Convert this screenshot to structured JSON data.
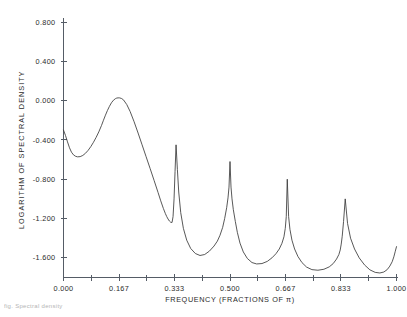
{
  "figure": {
    "caption_partial": "fig. Spectral density"
  },
  "chart_data": {
    "type": "line",
    "title": "",
    "xlabel": "FREQUENCY (FRACTIONS OF π)",
    "ylabel": "LOGARITHM OF SPECTRAL DENSITY",
    "xlim": [
      0.0,
      1.0
    ],
    "ylim": [
      -1.8,
      0.8
    ],
    "grid": false,
    "legend": "none",
    "xticks": [
      0.0,
      0.167,
      0.333,
      0.5,
      0.667,
      0.833,
      1.0
    ],
    "xticklabels": [
      "0.000",
      "0.167",
      "0.333",
      "0.500",
      "0.667",
      "0.833",
      "1.000"
    ],
    "xminor_ticks": [
      0.0833,
      0.25,
      0.4167,
      0.5833,
      0.75,
      0.9167
    ],
    "yticks": [
      0.8,
      0.4,
      0.0,
      -0.4,
      -0.8,
      -1.2,
      -1.6
    ],
    "yticklabels": [
      "0.800",
      "0.400",
      "0.000",
      "-0.400",
      "-0.800",
      "-1.200",
      "-1.600"
    ],
    "line_color": "#3a3a3a",
    "axis_color": "#555c66",
    "background": "#ffffff",
    "annotations": [
      {
        "text": "harmonic peak",
        "x": 0.333,
        "y": -0.45
      },
      {
        "text": "harmonic peak",
        "x": 0.5,
        "y": -0.62
      },
      {
        "text": "harmonic peak",
        "x": 0.667,
        "y": -0.8
      },
      {
        "text": "harmonic peak",
        "x": 0.833,
        "y": -1.0
      },
      {
        "text": "plateau",
        "x": 0.135,
        "y": 0.03
      }
    ],
    "x": [
      0.0,
      0.006,
      0.012,
      0.018,
      0.024,
      0.03,
      0.036,
      0.042,
      0.05,
      0.058,
      0.066,
      0.074,
      0.082,
      0.09,
      0.098,
      0.106,
      0.114,
      0.12,
      0.126,
      0.132,
      0.138,
      0.144,
      0.15,
      0.156,
      0.16,
      0.164,
      0.168,
      0.174,
      0.18,
      0.19,
      0.2,
      0.212,
      0.224,
      0.236,
      0.248,
      0.26,
      0.272,
      0.284,
      0.292,
      0.3,
      0.306,
      0.31,
      0.314,
      0.318,
      0.322,
      0.326,
      0.329,
      0.332,
      0.335,
      0.338,
      0.342,
      0.346,
      0.352,
      0.36,
      0.37,
      0.382,
      0.396,
      0.41,
      0.424,
      0.438,
      0.452,
      0.462,
      0.47,
      0.478,
      0.484,
      0.49,
      0.494,
      0.497,
      0.5,
      0.503,
      0.506,
      0.51,
      0.516,
      0.522,
      0.53,
      0.54,
      0.552,
      0.566,
      0.58,
      0.596,
      0.612,
      0.626,
      0.638,
      0.648,
      0.656,
      0.662,
      0.666,
      0.669,
      0.672,
      0.676,
      0.68,
      0.686,
      0.694,
      0.704,
      0.716,
      0.73,
      0.746,
      0.764,
      0.782,
      0.798,
      0.81,
      0.82,
      0.827,
      0.831,
      0.834,
      0.837,
      0.841,
      0.846,
      0.853,
      0.862,
      0.874,
      0.888,
      0.904,
      0.92,
      0.936,
      0.95,
      0.962,
      0.972,
      0.98,
      0.987,
      0.992,
      0.996,
      1.0
    ],
    "y": [
      -0.3,
      -0.355,
      -0.42,
      -0.48,
      -0.525,
      -0.552,
      -0.566,
      -0.572,
      -0.57,
      -0.558,
      -0.536,
      -0.506,
      -0.468,
      -0.424,
      -0.374,
      -0.318,
      -0.254,
      -0.2,
      -0.148,
      -0.1,
      -0.058,
      -0.022,
      0.004,
      0.02,
      0.026,
      0.028,
      0.028,
      0.022,
      0.008,
      -0.04,
      -0.11,
      -0.215,
      -0.33,
      -0.45,
      -0.57,
      -0.69,
      -0.812,
      -0.935,
      -1.02,
      -1.098,
      -1.15,
      -1.18,
      -1.205,
      -1.225,
      -1.238,
      -1.24,
      -1.18,
      -1.0,
      -0.72,
      -0.45,
      -0.7,
      -0.93,
      -1.14,
      -1.3,
      -1.42,
      -1.505,
      -1.556,
      -1.576,
      -1.566,
      -1.532,
      -1.48,
      -1.43,
      -1.37,
      -1.29,
      -1.2,
      -1.09,
      -0.99,
      -0.88,
      -0.62,
      -0.88,
      -1.0,
      -1.11,
      -1.23,
      -1.34,
      -1.45,
      -1.54,
      -1.606,
      -1.648,
      -1.662,
      -1.658,
      -1.636,
      -1.6,
      -1.558,
      -1.51,
      -1.452,
      -1.386,
      -1.3,
      -1.18,
      -0.8,
      -1.18,
      -1.31,
      -1.42,
      -1.51,
      -1.586,
      -1.648,
      -1.694,
      -1.72,
      -1.726,
      -1.716,
      -1.692,
      -1.658,
      -1.612,
      -1.566,
      -1.52,
      -1.46,
      -1.38,
      -1.23,
      -1.0,
      -1.25,
      -1.4,
      -1.51,
      -1.6,
      -1.672,
      -1.722,
      -1.748,
      -1.754,
      -1.744,
      -1.72,
      -1.684,
      -1.64,
      -1.59,
      -1.538,
      -1.486,
      -1.43,
      -1.36,
      -1.28,
      -1.21
    ]
  }
}
